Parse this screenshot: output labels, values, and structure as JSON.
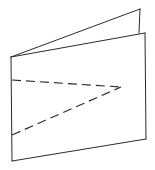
{
  "figure": {
    "background_color": "#ffffff",
    "stroke_color": "#2b2b2b",
    "canvas": {
      "width": 155,
      "height": 170
    },
    "line_styles": {
      "visible": "solid",
      "hidden": "dashed",
      "dash_pattern": "9 5",
      "stroke_width": 1
    },
    "vertices": {
      "fold_top": {
        "label": "fold-top",
        "x": 11,
        "y": 57
      },
      "fold_bottom": {
        "label": "fold-bottom",
        "x": 12,
        "y": 161
      },
      "front_top_right": {
        "label": "front-top-right",
        "x": 145,
        "y": 33
      },
      "front_bottom_right": {
        "label": "front-bottom-right",
        "x": 146,
        "y": 139
      },
      "back_top_apex": {
        "label": "back-top-apex",
        "x": 140,
        "y": 9
      },
      "back_right_lower": {
        "label": "back-right-lower",
        "x": 139,
        "y": 33
      },
      "hidden_apex": {
        "label": "hidden-apex",
        "x": 121,
        "y": 87
      },
      "hidden_upper_start": {
        "label": "hidden-upper-start",
        "x": 12,
        "y": 80
      },
      "hidden_lower_start": {
        "label": "hidden-lower-start",
        "x": 12,
        "y": 135
      }
    },
    "edges": [
      {
        "name": "fold-vertical-edge",
        "style": "solid",
        "from": "fold_top",
        "to": "fold_bottom"
      },
      {
        "name": "front-top-edge",
        "style": "solid",
        "from": "fold_top",
        "to": "front_top_right"
      },
      {
        "name": "front-right-edge",
        "style": "solid",
        "from": "front_top_right",
        "to": "front_bottom_right"
      },
      {
        "name": "front-bottom-edge",
        "style": "solid",
        "from": "fold_bottom",
        "to": "front_bottom_right"
      },
      {
        "name": "back-top-edge",
        "style": "solid",
        "from": "fold_top",
        "to": "back_top_apex"
      },
      {
        "name": "back-right-edge",
        "style": "solid",
        "from": "back_top_apex",
        "to": "back_right_lower"
      },
      {
        "name": "hidden-upper-edge",
        "style": "dashed",
        "from": "hidden_upper_start",
        "to": "hidden_apex"
      },
      {
        "name": "hidden-lower-edge",
        "style": "dashed",
        "from": "hidden_lower_start",
        "to": "hidden_apex"
      }
    ],
    "paths": {
      "front_face": "M 11 57 L 145 33 L 146 139 L 12 161 Z",
      "back_flap": "M 11 57 L 140 9 L 139 33 Z",
      "fold_edge": "M 11 57 L 12 161",
      "front_top": "M 11 57 L 145 33",
      "front_right": "M 145 33 L 146 139",
      "front_bottom": "M 12 161 L 146 139",
      "back_top": "M 11 57 L 140 9",
      "back_right": "M 140 9 L 139 33",
      "hidden_upper": "M 12 80 L 121 87",
      "hidden_lower": "M 12 135 L 121 87"
    }
  }
}
